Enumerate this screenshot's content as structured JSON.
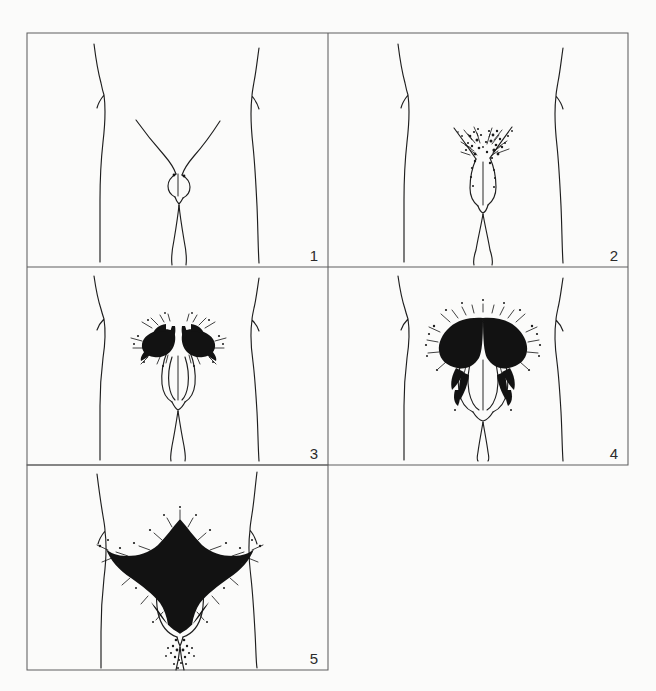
{
  "figure": {
    "kind": "line-drawing-plate",
    "background_color": "#fbfbfa",
    "ink_color": "#1e1e1e",
    "frame_color": "#5f5f5f",
    "grid": {
      "left": 27,
      "top": 33,
      "right": 628,
      "bottom": 670,
      "column_divider_x": 328,
      "row_divider_1_y": 267,
      "row_divider_2_y": 465,
      "columns": 2,
      "rows": 3
    },
    "panels": [
      {
        "number": "1",
        "label_position": "bottom-right",
        "stage": 1,
        "hair_density": "none",
        "hair_spread": "none",
        "box": {
          "x": 27,
          "y": 33,
          "w": 301,
          "h": 234
        }
      },
      {
        "number": "2",
        "label_position": "bottom-right",
        "stage": 2,
        "hair_density": "sparse",
        "hair_spread": "along-labia",
        "box": {
          "x": 328,
          "y": 33,
          "w": 300,
          "h": 234
        }
      },
      {
        "number": "3",
        "label_position": "bottom-right",
        "stage": 3,
        "hair_density": "moderate-darker-coarser",
        "hair_spread": "sparsely-over-junction-of-pubes",
        "box": {
          "x": 27,
          "y": 267,
          "w": 301,
          "h": 198
        }
      },
      {
        "number": "4",
        "label_position": "bottom-right",
        "stage": 4,
        "hair_density": "adult-type-but-reduced-area",
        "hair_spread": "no-spread-to-medial-thigh",
        "box": {
          "x": 328,
          "y": 267,
          "w": 300,
          "h": 198
        }
      },
      {
        "number": "5",
        "label_position": "bottom-right",
        "stage": 5,
        "hair_density": "adult-quantity-and-type",
        "hair_spread": "inverse-triangle-with-thigh-spread",
        "box": {
          "x": 27,
          "y": 465,
          "w": 301,
          "h": 205
        }
      }
    ]
  }
}
